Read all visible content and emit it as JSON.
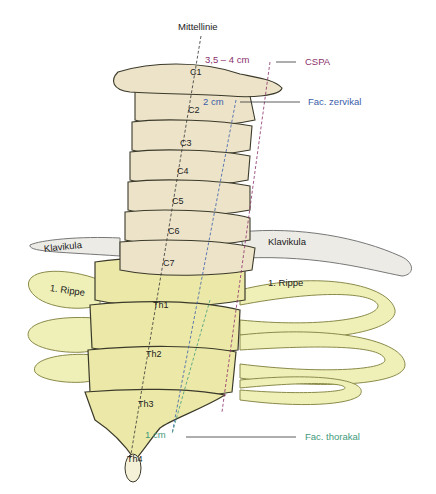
{
  "title": "Mittellinie",
  "measurements": {
    "cspa": {
      "distance": "3,5 – 4 cm",
      "label": "CSPA",
      "color": "#8b2f6b"
    },
    "fac_zervikal": {
      "distance": "2 cm",
      "label": "Fac. zervikal",
      "color": "#3a5ea8"
    },
    "fac_thorakal": {
      "distance": "1 cm",
      "label": "Fac. thorakal",
      "color": "#3f9a7c"
    }
  },
  "structures": {
    "clavicle_left": "Klavikula",
    "clavicle_right": "Klavikula",
    "rib_left": "1. Rippe",
    "rib_right": "1. Rippe"
  },
  "vertebrae": [
    "C1",
    "C2",
    "C3",
    "C4",
    "C5",
    "C6",
    "C7",
    "Th1",
    "Th2",
    "Th3",
    "Th4"
  ],
  "colors": {
    "cervical_bone": "#ece3c9",
    "thoracic_bone": "#ece9a8",
    "rib": "#eef0b8",
    "clavicle": "#ecebe6",
    "disc": "#cfe0ec",
    "outline": "#3b3a2a"
  }
}
